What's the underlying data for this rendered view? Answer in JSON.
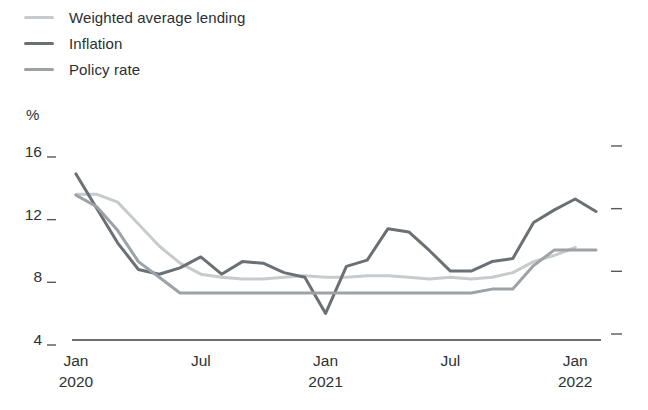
{
  "chart_data": {
    "type": "line",
    "title": "",
    "unit_label": "%",
    "grid": false,
    "legend_position": "top-left",
    "x": [
      "Jan 2020",
      "Feb 2020",
      "Mar 2020",
      "Apr 2020",
      "May 2020",
      "Jun 2020",
      "Jul 2020",
      "Aug 2020",
      "Sep 2020",
      "Oct 2020",
      "Nov 2020",
      "Dec 2020",
      "Jan 2021",
      "Feb 2021",
      "Mar 2021",
      "Apr 2021",
      "May 2021",
      "Jun 2021",
      "Jul 2021",
      "Aug 2021",
      "Sep 2021",
      "Oct 2021",
      "Nov 2021",
      "Dec 2021",
      "Jan 2022",
      "Feb 2022"
    ],
    "x_ticks": [
      {
        "index": 0,
        "line1": "Jan",
        "line2": "2020"
      },
      {
        "index": 6,
        "line1": "Jul",
        "line2": ""
      },
      {
        "index": 12,
        "line1": "Jan",
        "line2": "2021"
      },
      {
        "index": 18,
        "line1": "Jul",
        "line2": ""
      },
      {
        "index": 24,
        "line1": "Jan",
        "line2": "2022"
      }
    ],
    "y_ticks": [
      4,
      8,
      12,
      16
    ],
    "ylim": [
      4,
      16.5
    ],
    "series": [
      {
        "name": "Weighted average lending",
        "color": "#c7cbce",
        "values": [
          13.3,
          13.3,
          12.8,
          11.4,
          10.0,
          8.9,
          8.2,
          8.0,
          7.9,
          7.9,
          8.0,
          8.1,
          8.0,
          8.0,
          8.1,
          8.1,
          8.0,
          7.9,
          8.0,
          7.9,
          8.0,
          8.3,
          9.0,
          9.4,
          9.9,
          null
        ]
      },
      {
        "name": "Inflation",
        "color": "#6b7075",
        "values": [
          14.6,
          12.4,
          10.2,
          8.5,
          8.2,
          8.6,
          9.3,
          8.2,
          9.0,
          8.9,
          8.3,
          8.0,
          5.7,
          8.7,
          9.1,
          11.1,
          10.9,
          9.7,
          8.4,
          8.4,
          9.0,
          9.2,
          11.5,
          12.3,
          13.0,
          12.2
        ]
      },
      {
        "name": "Policy rate",
        "color": "#9da2a7",
        "values": [
          13.25,
          12.5,
          11.0,
          9.0,
          8.0,
          7.0,
          7.0,
          7.0,
          7.0,
          7.0,
          7.0,
          7.0,
          7.0,
          7.0,
          7.0,
          7.0,
          7.0,
          7.0,
          7.0,
          7.0,
          7.25,
          7.25,
          8.75,
          9.75,
          9.75,
          9.75
        ]
      }
    ],
    "axis_color": "#3c4043",
    "tick_text_color": "#2d3134"
  }
}
